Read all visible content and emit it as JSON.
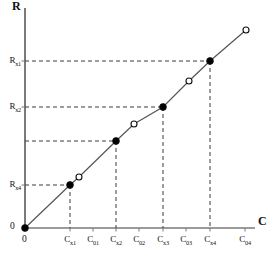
{
  "chart_data": {
    "type": "line",
    "title": "",
    "xlabel": "C",
    "ylabel": "R",
    "grid": false,
    "legend": null,
    "xlim": [
      0,
      10
    ],
    "ylim": [
      0,
      10
    ],
    "origin_label_x": "0",
    "origin_label_y": "0",
    "xtick_labels": [
      "0",
      "C_x1",
      "C_01",
      "C_x2",
      "C_02",
      "C_x3",
      "C_03",
      "C_x4",
      "C_04"
    ],
    "ytick_labels": [
      "0",
      "R_x4",
      "R_x2",
      "R_x1"
    ],
    "x_ticks": [
      {
        "id": "tick-0",
        "base": "0",
        "sub": "",
        "px": 25
      },
      {
        "id": "tick-cx1",
        "base": "C",
        "sub": "x1",
        "px": 70
      },
      {
        "id": "tick-c01",
        "base": "C",
        "sub": "01",
        "px": 93
      },
      {
        "id": "tick-cx2",
        "base": "C",
        "sub": "x2",
        "px": 116
      },
      {
        "id": "tick-c02",
        "base": "C",
        "sub": "02",
        "px": 139
      },
      {
        "id": "tick-cx3",
        "base": "C",
        "sub": "x3",
        "px": 163
      },
      {
        "id": "tick-c03",
        "base": "C",
        "sub": "03",
        "px": 186
      },
      {
        "id": "tick-cx4",
        "base": "C",
        "sub": "x4",
        "px": 210
      },
      {
        "id": "tick-c04",
        "base": "C",
        "sub": "04",
        "px": 245
      }
    ],
    "y_ticks": [
      {
        "id": "ytick-rx1",
        "base": "R",
        "sub": "x1",
        "py": 61
      },
      {
        "id": "ytick-rx2",
        "base": "R",
        "sub": "x2",
        "py": 107
      },
      {
        "id": "ytick-rx4",
        "base": "R",
        "sub": "x4",
        "py": 185
      }
    ],
    "series": [
      {
        "name": "response-line",
        "type": "line",
        "points_px": [
          {
            "x": 25,
            "y": 228,
            "marker": "filled"
          },
          {
            "x": 70,
            "y": 185,
            "marker": "filled"
          },
          {
            "x": 79,
            "y": 177,
            "marker": "open"
          },
          {
            "x": 116,
            "y": 141,
            "marker": "filled"
          },
          {
            "x": 134,
            "y": 124,
            "marker": "open"
          },
          {
            "x": 163,
            "y": 107,
            "marker": "filled"
          },
          {
            "x": 189,
            "y": 81,
            "marker": "open"
          },
          {
            "x": 210,
            "y": 61,
            "marker": "filled"
          },
          {
            "x": 246,
            "y": 30,
            "marker": "open"
          }
        ]
      }
    ],
    "drop_lines_px": [
      {
        "x": 70,
        "y": 185
      },
      {
        "x": 116,
        "y": 141
      },
      {
        "x": 163,
        "y": 107
      },
      {
        "x": 210,
        "y": 61
      }
    ],
    "level_lines_px": [
      {
        "y": 61,
        "x": 210,
        "labeled": true
      },
      {
        "y": 107,
        "x": 163,
        "labeled": true
      },
      {
        "y": 141,
        "x": 116,
        "labeled": false
      },
      {
        "y": 185,
        "x": 70,
        "labeled": true
      }
    ],
    "colors": {
      "axis": "#7a7a7a",
      "line": "#555555",
      "marker_fill": "#000000",
      "marker_edge": "#111111",
      "dash": "#3a3a3a",
      "text": "#111111",
      "background": "#ffffff"
    },
    "axes_px": {
      "origin_x": 25,
      "origin_y": 228,
      "y_axis_top": 8,
      "x_axis_right": 255
    }
  }
}
